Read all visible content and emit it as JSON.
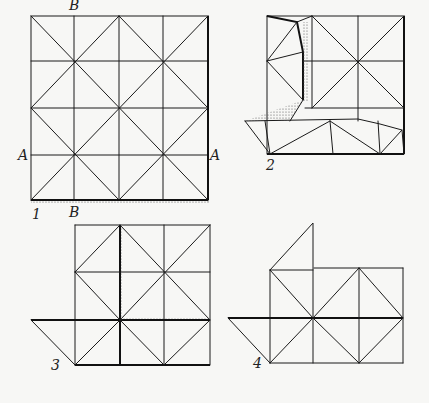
{
  "diagram": {
    "type": "origami folding instructions",
    "steps": [
      {
        "number": "1",
        "label_left": "A",
        "label_right": "A",
        "label_top": "B",
        "label_bottom": "B"
      },
      {
        "number": "2"
      },
      {
        "number": "3"
      },
      {
        "number": "4"
      }
    ]
  }
}
